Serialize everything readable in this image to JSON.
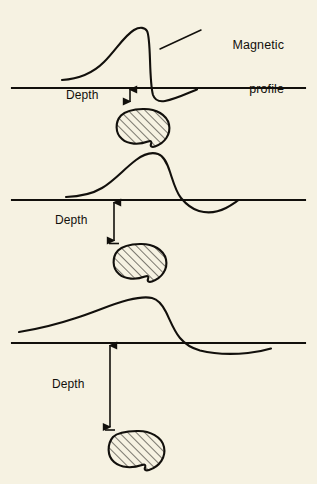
{
  "figure": {
    "domain": "Diagram",
    "background_color": "#f6f2e2",
    "ink_color": "#12100c",
    "width": 317,
    "height": 484
  },
  "labels": {
    "callout": {
      "line1": "Magnetic",
      "line2": "profile",
      "x": 198,
      "y": 10,
      "leader_from_x": 160,
      "leader_from_y": 49,
      "leader_to_x": 201,
      "leader_to_y": 30
    },
    "depth_1": {
      "text": "Depth",
      "x": 66,
      "y": 89
    },
    "depth_2": {
      "text": "Depth",
      "x": 55,
      "y": 214
    },
    "depth_3": {
      "text": "Depth",
      "x": 52,
      "y": 378
    }
  },
  "panels": [
    {
      "name": "shallow-panel",
      "baseline_y": 88,
      "baseline_x1": 12,
      "baseline_x2": 305,
      "depth_arrow": {
        "x": 130,
        "y_top": 89,
        "y_bottom": 102,
        "length": 13
      },
      "blob": {
        "cx": 143,
        "cy": 129,
        "rx": 26,
        "ry": 20
      },
      "curve": {
        "peak_x": 147,
        "peak_y": 29,
        "amplitude_px": 59,
        "trough_min_y": 99,
        "zero_crossing_x": 157,
        "width_class": "narrow"
      }
    },
    {
      "name": "intermediate-panel",
      "baseline_y": 200,
      "baseline_x1": 12,
      "baseline_x2": 305,
      "depth_arrow": {
        "x": 114,
        "y_top": 202,
        "y_bottom": 241,
        "length": 39
      },
      "blob": {
        "cx": 140,
        "cy": 264,
        "rx": 26,
        "ry": 21
      },
      "curve": {
        "peak_x": 155,
        "peak_y": 154,
        "amplitude_px": 46,
        "trough_min_y": 211,
        "zero_crossing_x": 186,
        "width_class": "medium"
      }
    },
    {
      "name": "deep-panel",
      "baseline_y": 343,
      "baseline_x1": 12,
      "baseline_x2": 305,
      "depth_arrow": {
        "x": 110,
        "y_top": 345,
        "y_bottom": 428,
        "length": 83
      },
      "blob": {
        "cx": 137,
        "cy": 452,
        "rx": 27,
        "ry": 22
      },
      "curve": {
        "peak_x": 152,
        "peak_y": 297,
        "amplitude_px": 46,
        "trough_min_y": 352,
        "zero_crossing_x": 185,
        "width_class": "broad"
      }
    }
  ],
  "hatching": {
    "angle_deg": 45,
    "spacing_px": 6,
    "stroke_width": 1.1
  }
}
